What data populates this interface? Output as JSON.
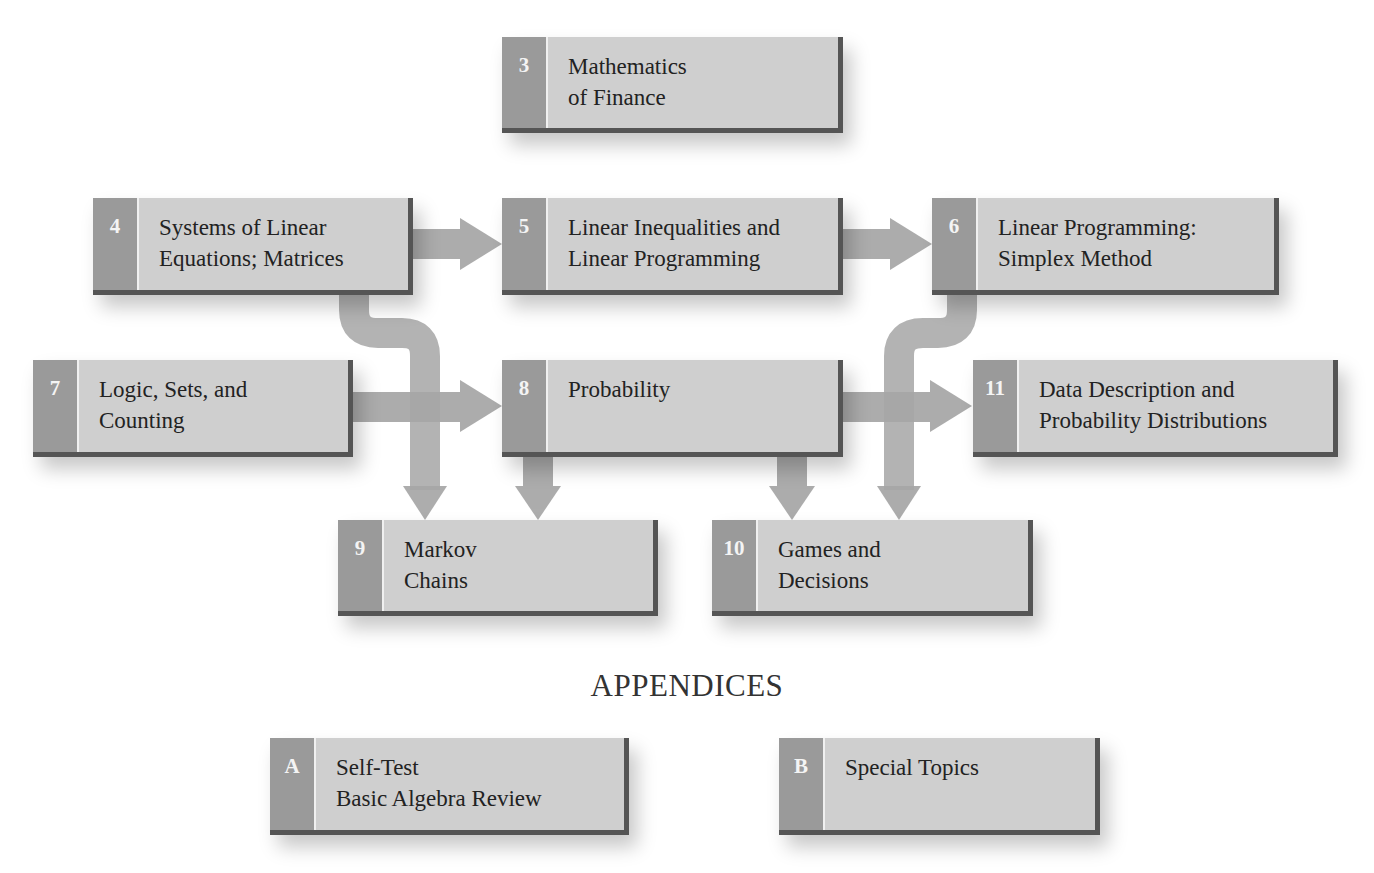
{
  "diagram": {
    "type": "chapter-dependency-flowchart",
    "colors": {
      "box_fill": "#cfcfcf",
      "number_strip": "#9a9a9a",
      "box_border": "#555555",
      "arrow": "#a6a6a6",
      "text": "#222222",
      "number_text": "#f4f4f4"
    },
    "chapters": [
      {
        "id": "3",
        "number": "3",
        "title": "Mathematics\nof Finance"
      },
      {
        "id": "4",
        "number": "4",
        "title": "Systems of Linear\nEquations; Matrices"
      },
      {
        "id": "5",
        "number": "5",
        "title": "Linear Inequalities and\nLinear Programming"
      },
      {
        "id": "6",
        "number": "6",
        "title": "Linear Programming:\nSimplex Method"
      },
      {
        "id": "7",
        "number": "7",
        "title": "Logic, Sets, and\nCounting"
      },
      {
        "id": "8",
        "number": "8",
        "title": "Probability"
      },
      {
        "id": "11",
        "number": "11",
        "title": "Data Description and\nProbability Distributions"
      },
      {
        "id": "9",
        "number": "9",
        "title": "Markov\nChains"
      },
      {
        "id": "10",
        "number": "10",
        "title": "Games and\nDecisions"
      }
    ],
    "appendices_heading": "APPENDICES",
    "appendices": [
      {
        "id": "A",
        "number": "A",
        "title": "Self-Test\nBasic Algebra Review"
      },
      {
        "id": "B",
        "number": "B",
        "title": "Special Topics"
      }
    ],
    "edges": [
      {
        "from": "4",
        "to": "5"
      },
      {
        "from": "5",
        "to": "6"
      },
      {
        "from": "7",
        "to": "8"
      },
      {
        "from": "8",
        "to": "11"
      },
      {
        "from": "4",
        "to": "9"
      },
      {
        "from": "8",
        "to": "9"
      },
      {
        "from": "8",
        "to": "10"
      },
      {
        "from": "6",
        "to": "10"
      }
    ]
  }
}
